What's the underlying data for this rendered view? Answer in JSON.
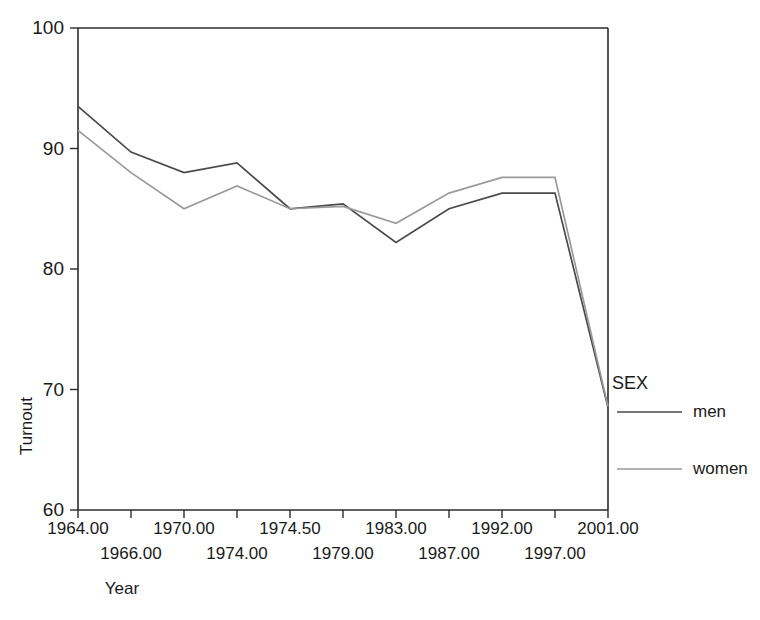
{
  "chart_data": {
    "type": "line",
    "title": "",
    "xlabel": "Year",
    "ylabel": "Turnout",
    "ylim": [
      60,
      100
    ],
    "yticks": [
      60,
      70,
      80,
      90,
      100
    ],
    "ytick_labels": [
      "60",
      "70",
      "80",
      "90",
      "100"
    ],
    "grid": false,
    "legend_position": "right",
    "legend_title": "SEX",
    "categories": [
      "1964.00",
      "1966.00",
      "1970.00",
      "1974.00",
      "1974.50",
      "1979.00",
      "1983.00",
      "1987.00",
      "1992.00",
      "1997.00",
      "2001.00"
    ],
    "series": [
      {
        "name": "men",
        "color": "#4a4a4a",
        "values": [
          93.5,
          89.7,
          88.0,
          88.8,
          85.0,
          85.4,
          82.2,
          85.0,
          86.3,
          86.3,
          68.5
        ]
      },
      {
        "name": "women",
        "color": "#9a9a9a",
        "values": [
          91.5,
          88.0,
          85.0,
          86.9,
          85.0,
          85.2,
          83.8,
          86.3,
          87.6,
          87.6,
          68.6
        ]
      }
    ]
  },
  "axes": {
    "y_title": "Turnout",
    "x_title": "Year"
  },
  "legend": {
    "title": "SEX",
    "entries": [
      {
        "label": "men",
        "color": "#4a4a4a"
      },
      {
        "label": "women",
        "color": "#9a9a9a"
      }
    ]
  }
}
